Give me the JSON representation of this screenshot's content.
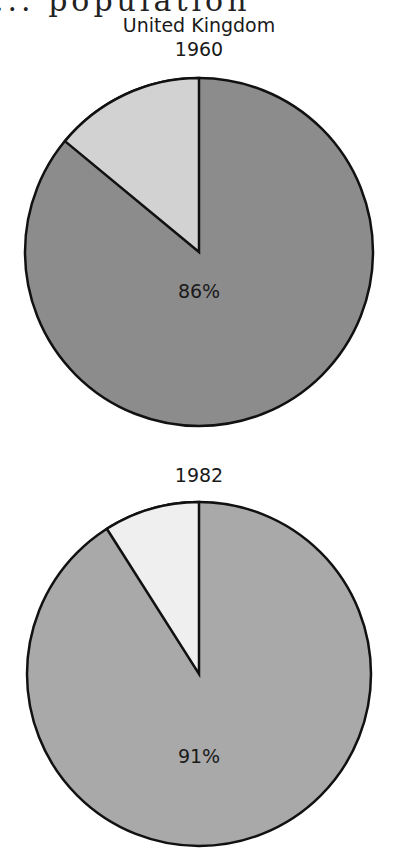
{
  "heading_fragment": "... population",
  "country": "United Kingdom",
  "charts": [
    {
      "year": "1960",
      "major_label": "86%",
      "major": 86,
      "minor": 14,
      "major_color": "#8c8c8c",
      "minor_color": "#d2d2d2"
    },
    {
      "year": "1982",
      "major_label": "91%",
      "major": 91,
      "minor": 9,
      "major_color": "#a9a9a9",
      "minor_color": "#efefef"
    }
  ],
  "chart_data": [
    {
      "type": "pie",
      "title": "United Kingdom 1960",
      "categories": [
        "Main share",
        "Remainder"
      ],
      "values": [
        86,
        14
      ],
      "annotations": [
        "86%"
      ],
      "legend": "none"
    },
    {
      "type": "pie",
      "title": "1982",
      "categories": [
        "Main share",
        "Remainder"
      ],
      "values": [
        91,
        9
      ],
      "annotations": [
        "91%"
      ],
      "legend": "none"
    }
  ]
}
